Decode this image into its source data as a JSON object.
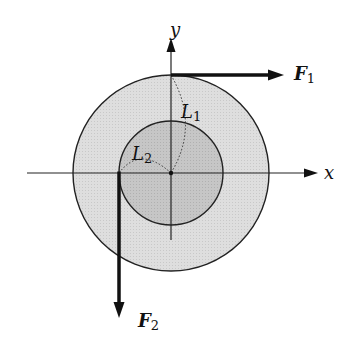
{
  "diagram": {
    "colors": {
      "outer_disc": "#dcdcdc",
      "inner_disc": "#c4c4c4",
      "stroke": "#222222",
      "arrow": "#111111"
    },
    "axes": {
      "x_label": "x",
      "y_label": "y"
    },
    "forces": [
      {
        "name": "F",
        "subscript": "1",
        "direction": "right",
        "applied_at": "top of outer disc"
      },
      {
        "name": "F",
        "subscript": "2",
        "direction": "down",
        "applied_at": "left of inner disc"
      }
    ],
    "radii": [
      {
        "name": "L",
        "subscript": "1",
        "refers_to": "outer disc radius"
      },
      {
        "name": "L",
        "subscript": "2",
        "refers_to": "inner disc radius"
      }
    ]
  }
}
